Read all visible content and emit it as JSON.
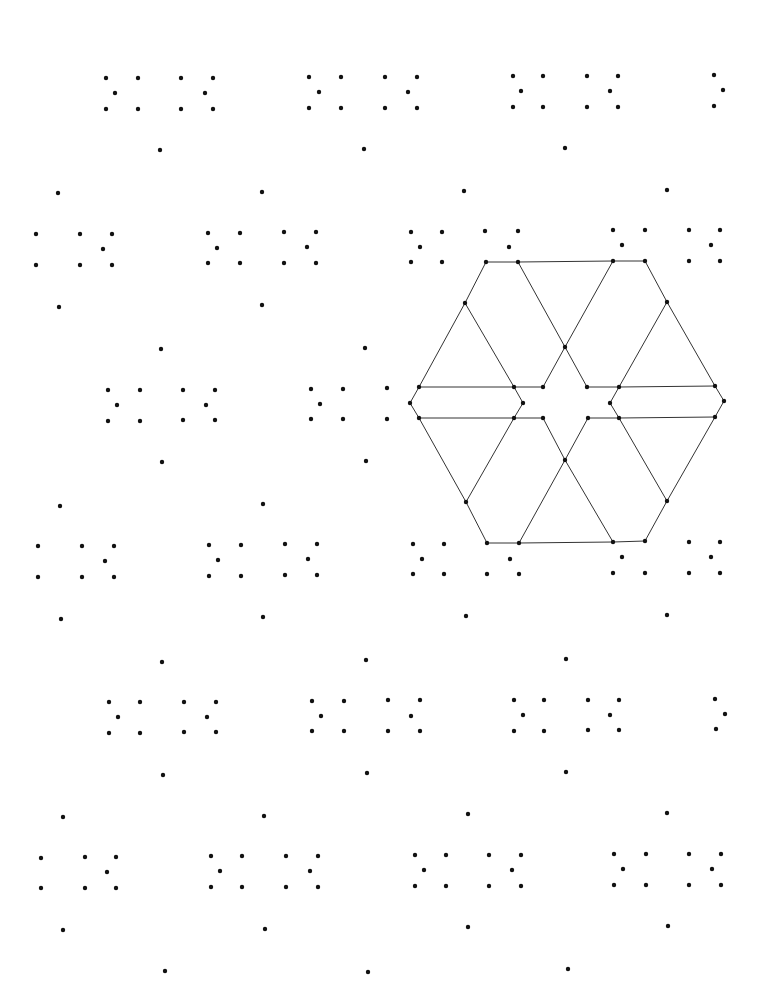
{
  "canvas": {
    "width": 758,
    "height": 1002,
    "background": "#ffffff"
  },
  "style": {
    "dot_color": "#111111",
    "dot_radius": 2.2,
    "line_color": "#333333",
    "line_width": 1
  },
  "dots": [
    [
      106,
      78
    ],
    [
      138,
      78
    ],
    [
      115,
      93
    ],
    [
      106,
      109
    ],
    [
      138,
      109
    ],
    [
      181,
      78
    ],
    [
      213,
      78
    ],
    [
      205,
      93
    ],
    [
      181,
      109
    ],
    [
      213,
      109
    ],
    [
      309,
      77
    ],
    [
      341,
      77
    ],
    [
      319,
      92
    ],
    [
      309,
      108
    ],
    [
      341,
      108
    ],
    [
      385,
      77
    ],
    [
      417,
      77
    ],
    [
      408,
      92
    ],
    [
      385,
      108
    ],
    [
      417,
      108
    ],
    [
      513,
      76
    ],
    [
      543,
      76
    ],
    [
      521,
      91
    ],
    [
      513,
      107
    ],
    [
      543,
      107
    ],
    [
      587,
      76
    ],
    [
      618,
      76
    ],
    [
      610,
      91
    ],
    [
      587,
      107
    ],
    [
      618,
      107
    ],
    [
      714,
      75
    ],
    [
      723,
      90
    ],
    [
      714,
      106
    ],
    [
      160,
      150
    ],
    [
      364,
      149
    ],
    [
      565,
      148
    ],
    [
      58,
      193
    ],
    [
      262,
      192
    ],
    [
      464,
      191
    ],
    [
      667,
      190
    ],
    [
      36,
      234
    ],
    [
      80,
      234
    ],
    [
      112,
      234
    ],
    [
      103,
      249
    ],
    [
      36,
      265
    ],
    [
      80,
      265
    ],
    [
      112,
      265
    ],
    [
      208,
      233
    ],
    [
      240,
      233
    ],
    [
      217,
      248
    ],
    [
      208,
      263
    ],
    [
      240,
      263
    ],
    [
      284,
      232
    ],
    [
      316,
      232
    ],
    [
      307,
      247
    ],
    [
      284,
      263
    ],
    [
      316,
      263
    ],
    [
      411,
      232
    ],
    [
      442,
      232
    ],
    [
      420,
      247
    ],
    [
      411,
      262
    ],
    [
      442,
      262
    ],
    [
      485,
      231
    ],
    [
      518,
      231
    ],
    [
      509,
      247
    ],
    [
      613,
      230
    ],
    [
      645,
      230
    ],
    [
      622,
      245
    ],
    [
      689,
      230
    ],
    [
      720,
      230
    ],
    [
      711,
      245
    ],
    [
      689,
      261
    ],
    [
      720,
      261
    ],
    [
      59,
      307
    ],
    [
      262,
      305
    ],
    [
      161,
      349
    ],
    [
      365,
      348
    ],
    [
      108,
      390
    ],
    [
      140,
      390
    ],
    [
      117,
      405
    ],
    [
      108,
      421
    ],
    [
      140,
      421
    ],
    [
      183,
      390
    ],
    [
      215,
      390
    ],
    [
      206,
      405
    ],
    [
      183,
      420
    ],
    [
      215,
      420
    ],
    [
      311,
      389
    ],
    [
      343,
      389
    ],
    [
      320,
      404
    ],
    [
      311,
      419
    ],
    [
      343,
      419
    ],
    [
      387,
      388
    ],
    [
      387,
      419
    ],
    [
      162,
      462
    ],
    [
      366,
      461
    ],
    [
      60,
      506
    ],
    [
      263,
      504
    ],
    [
      38,
      546
    ],
    [
      82,
      546
    ],
    [
      114,
      546
    ],
    [
      105,
      561
    ],
    [
      38,
      577
    ],
    [
      82,
      577
    ],
    [
      114,
      577
    ],
    [
      209,
      545
    ],
    [
      241,
      545
    ],
    [
      218,
      560
    ],
    [
      209,
      576
    ],
    [
      241,
      576
    ],
    [
      285,
      544
    ],
    [
      317,
      544
    ],
    [
      308,
      559
    ],
    [
      285,
      575
    ],
    [
      317,
      575
    ],
    [
      413,
      544
    ],
    [
      444,
      544
    ],
    [
      422,
      559
    ],
    [
      413,
      574
    ],
    [
      444,
      574
    ],
    [
      487,
      574
    ],
    [
      510,
      559
    ],
    [
      519,
      574
    ],
    [
      613,
      573
    ],
    [
      645,
      573
    ],
    [
      622,
      557
    ],
    [
      689,
      542
    ],
    [
      720,
      542
    ],
    [
      711,
      557
    ],
    [
      689,
      573
    ],
    [
      720,
      573
    ],
    [
      61,
      619
    ],
    [
      263,
      617
    ],
    [
      466,
      616
    ],
    [
      667,
      615
    ],
    [
      162,
      662
    ],
    [
      366,
      660
    ],
    [
      566,
      659
    ],
    [
      109,
      702
    ],
    [
      140,
      702
    ],
    [
      118,
      717
    ],
    [
      109,
      733
    ],
    [
      140,
      733
    ],
    [
      184,
      702
    ],
    [
      216,
      702
    ],
    [
      207,
      717
    ],
    [
      184,
      732
    ],
    [
      216,
      732
    ],
    [
      312,
      701
    ],
    [
      344,
      701
    ],
    [
      321,
      716
    ],
    [
      312,
      731
    ],
    [
      344,
      731
    ],
    [
      388,
      700
    ],
    [
      388,
      731
    ],
    [
      420,
      700
    ],
    [
      411,
      716
    ],
    [
      420,
      731
    ],
    [
      514,
      700
    ],
    [
      544,
      700
    ],
    [
      523,
      715
    ],
    [
      514,
      731
    ],
    [
      544,
      731
    ],
    [
      588,
      700
    ],
    [
      619,
      700
    ],
    [
      610,
      715
    ],
    [
      588,
      730
    ],
    [
      619,
      730
    ],
    [
      715,
      699
    ],
    [
      725,
      714
    ],
    [
      716,
      729
    ],
    [
      163,
      775
    ],
    [
      367,
      773
    ],
    [
      566,
      772
    ],
    [
      63,
      817
    ],
    [
      264,
      816
    ],
    [
      468,
      814
    ],
    [
      667,
      813
    ],
    [
      41,
      858
    ],
    [
      85,
      857
    ],
    [
      116,
      857
    ],
    [
      107,
      872
    ],
    [
      41,
      888
    ],
    [
      85,
      888
    ],
    [
      116,
      888
    ],
    [
      211,
      856
    ],
    [
      242,
      856
    ],
    [
      220,
      871
    ],
    [
      211,
      887
    ],
    [
      242,
      887
    ],
    [
      286,
      856
    ],
    [
      318,
      856
    ],
    [
      310,
      871
    ],
    [
      286,
      887
    ],
    [
      318,
      887
    ],
    [
      415,
      855
    ],
    [
      446,
      855
    ],
    [
      424,
      870
    ],
    [
      415,
      886
    ],
    [
      446,
      886
    ],
    [
      489,
      855
    ],
    [
      521,
      855
    ],
    [
      512,
      870
    ],
    [
      489,
      886
    ],
    [
      521,
      886
    ],
    [
      614,
      854
    ],
    [
      646,
      854
    ],
    [
      623,
      869
    ],
    [
      614,
      885
    ],
    [
      646,
      885
    ],
    [
      689,
      854
    ],
    [
      721,
      854
    ],
    [
      712,
      869
    ],
    [
      689,
      885
    ],
    [
      721,
      885
    ],
    [
      63,
      930
    ],
    [
      265,
      929
    ],
    [
      468,
      927
    ],
    [
      668,
      926
    ],
    [
      165,
      971
    ],
    [
      368,
      972
    ],
    [
      568,
      969
    ]
  ],
  "hexagon": {
    "vertices": [
      [
        486,
        262
      ],
      [
        518,
        262
      ],
      [
        613,
        261
      ],
      [
        645,
        261
      ],
      [
        465,
        303
      ],
      [
        667,
        302
      ],
      [
        565,
        347
      ],
      [
        419,
        387
      ],
      [
        514,
        387
      ],
      [
        543,
        387
      ],
      [
        587,
        387
      ],
      [
        619,
        387
      ],
      [
        715,
        386
      ],
      [
        410,
        403
      ],
      [
        523,
        403
      ],
      [
        610,
        403
      ],
      [
        724,
        401
      ],
      [
        419,
        418
      ],
      [
        514,
        418
      ],
      [
        543,
        418
      ],
      [
        588,
        418
      ],
      [
        619,
        418
      ],
      [
        715,
        417
      ],
      [
        565,
        460
      ],
      [
        466,
        502
      ],
      [
        667,
        501
      ],
      [
        487,
        543
      ],
      [
        519,
        543
      ],
      [
        613,
        542
      ],
      [
        645,
        541
      ]
    ],
    "polylines": [
      [
        [
          486,
          262
        ],
        [
          518,
          262
        ],
        [
          613,
          261
        ],
        [
          645,
          261
        ],
        [
          667,
          302
        ],
        [
          715,
          386
        ],
        [
          724,
          401
        ],
        [
          715,
          417
        ],
        [
          667,
          501
        ],
        [
          645,
          541
        ],
        [
          613,
          542
        ],
        [
          519,
          543
        ],
        [
          487,
          543
        ],
        [
          466,
          502
        ],
        [
          419,
          418
        ],
        [
          410,
          403
        ],
        [
          419,
          387
        ],
        [
          465,
          303
        ],
        [
          486,
          262
        ]
      ],
      [
        [
          465,
          303
        ],
        [
          514,
          387
        ],
        [
          523,
          403
        ],
        [
          514,
          418
        ],
        [
          466,
          502
        ]
      ],
      [
        [
          419,
          387
        ],
        [
          514,
          387
        ],
        [
          543,
          387
        ]
      ],
      [
        [
          419,
          418
        ],
        [
          514,
          418
        ],
        [
          543,
          418
        ]
      ],
      [
        [
          518,
          262
        ],
        [
          565,
          347
        ],
        [
          587,
          387
        ]
      ],
      [
        [
          613,
          261
        ],
        [
          565,
          347
        ],
        [
          543,
          387
        ]
      ],
      [
        [
          667,
          302
        ],
        [
          619,
          387
        ],
        [
          610,
          403
        ],
        [
          619,
          418
        ],
        [
          667,
          501
        ]
      ],
      [
        [
          587,
          387
        ],
        [
          619,
          387
        ],
        [
          715,
          386
        ]
      ],
      [
        [
          588,
          418
        ],
        [
          619,
          418
        ],
        [
          715,
          417
        ]
      ],
      [
        [
          543,
          418
        ],
        [
          565,
          460
        ],
        [
          613,
          542
        ]
      ],
      [
        [
          588,
          418
        ],
        [
          565,
          460
        ],
        [
          519,
          543
        ]
      ]
    ]
  }
}
